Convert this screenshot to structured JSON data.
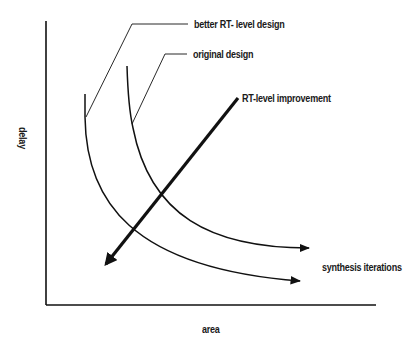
{
  "diagram": {
    "axes": {
      "x_label": "area",
      "y_label": "delay"
    },
    "curves": [
      {
        "name": "better RT-level design",
        "label": "better RT- level design"
      },
      {
        "name": "original design",
        "label": "original design"
      }
    ],
    "arrows": {
      "rt_level_improvement": "RT-level improvement",
      "synthesis_iterations": "synthesis iterations"
    },
    "colors": {
      "stroke": "#111111",
      "background": "#ffffff"
    }
  }
}
